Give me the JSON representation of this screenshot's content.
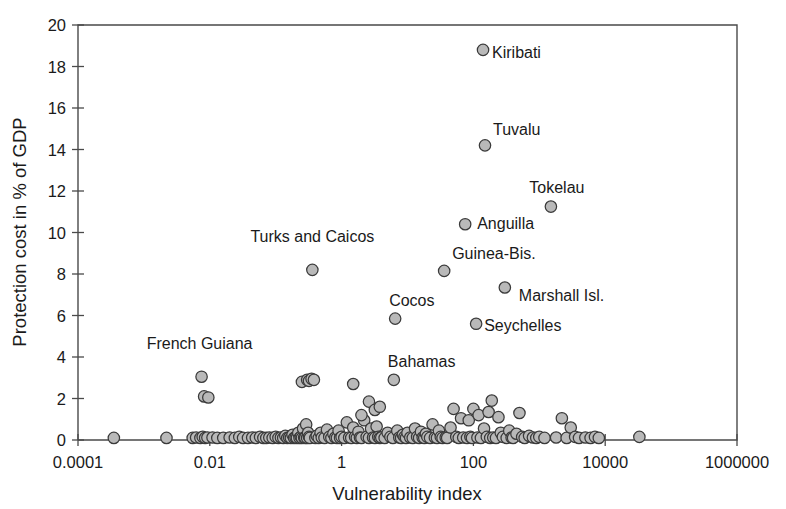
{
  "chart_data": {
    "type": "scatter",
    "title": "",
    "xlabel": "Vulnerability index",
    "ylabel": "Protection cost in % of GDP",
    "xscale": "log",
    "yscale": "linear",
    "xlim": [
      0.0001,
      1000000
    ],
    "ylim": [
      0,
      20
    ],
    "grid": false,
    "legend": null,
    "xticklabels": [
      "0.0001",
      "0.01",
      "1",
      "100",
      "10000",
      "1000000"
    ],
    "xtickvalues": [
      0.0001,
      0.01,
      1,
      100,
      10000,
      1000000
    ],
    "yticklabels": [
      "0",
      "2",
      "4",
      "6",
      "8",
      "10",
      "12",
      "14",
      "16",
      "18",
      "20"
    ],
    "ytickvalues": [
      0,
      2,
      4,
      6,
      8,
      10,
      12,
      14,
      16,
      18,
      20
    ],
    "marker_style": {
      "shape": "circle",
      "fill": "#b9b9b9",
      "edge": "#3a3a3a",
      "size": 7
    },
    "annotations": [
      {
        "label": "Kiribati",
        "x": 140,
        "y": 18.8,
        "anchor": "start",
        "dx": 9,
        "dy": 8
      },
      {
        "label": "Tuvalu",
        "x": 150,
        "y": 14.2,
        "anchor": "start",
        "dx": 8,
        "dy": -10
      },
      {
        "label": "Tokelau",
        "x": 1500,
        "y": 11.25,
        "anchor": "middle",
        "dx": 6,
        "dy": -14
      },
      {
        "label": "Anguilla",
        "x": 75,
        "y": 10.4,
        "anchor": "start",
        "dx": 12,
        "dy": 5
      },
      {
        "label": "Guinea-Bis.",
        "x": 36,
        "y": 8.15,
        "anchor": "start",
        "dx": 8,
        "dy": -12
      },
      {
        "label": "Marshall Isl.",
        "x": 300,
        "y": 7.35,
        "anchor": "start",
        "dx": 14,
        "dy": 14
      },
      {
        "label": "Cocos",
        "x": 6.5,
        "y": 5.85,
        "anchor": "start",
        "dx": -6,
        "dy": -13
      },
      {
        "label": "Seychelles",
        "x": 110,
        "y": 5.6,
        "anchor": "start",
        "dx": 8,
        "dy": 7
      },
      {
        "label": "Turks and Caicos",
        "x": 0.36,
        "y": 8.2,
        "anchor": "middle",
        "dx": 0,
        "dy": -28
      },
      {
        "label": "Bahamas",
        "x": 6.2,
        "y": 2.9,
        "anchor": "start",
        "dx": -6,
        "dy": -13
      },
      {
        "label": "French Guiana",
        "x": 0.007,
        "y": 3.05,
        "anchor": "middle",
        "dx": 0,
        "dy": -28
      }
    ],
    "labeled_points": [
      {
        "name": "Kiribati",
        "x": 140,
        "y": 18.8
      },
      {
        "name": "Tuvalu",
        "x": 150,
        "y": 14.2
      },
      {
        "name": "Tokelau",
        "x": 1500,
        "y": 11.25
      },
      {
        "name": "Anguilla",
        "x": 75,
        "y": 10.4
      },
      {
        "name": "Guinea-Bis.",
        "x": 36,
        "y": 8.15
      },
      {
        "name": "Marshall Isl.",
        "x": 300,
        "y": 7.35
      },
      {
        "name": "Cocos",
        "x": 6.5,
        "y": 5.85
      },
      {
        "name": "Seychelles",
        "x": 110,
        "y": 5.6
      },
      {
        "name": "Turks and Caicos",
        "x": 0.36,
        "y": 8.2
      },
      {
        "name": "Bahamas",
        "x": 6.2,
        "y": 2.9
      },
      {
        "name": "French Guiana",
        "x": 0.0075,
        "y": 3.05
      }
    ],
    "points": [
      [
        0.00035,
        0.1
      ],
      [
        0.0022,
        0.1
      ],
      [
        0.0055,
        0.1
      ],
      [
        0.0062,
        0.12
      ],
      [
        0.0072,
        0.1
      ],
      [
        0.0078,
        0.15
      ],
      [
        0.0085,
        0.1
      ],
      [
        0.0092,
        0.12
      ],
      [
        0.0075,
        3.05
      ],
      [
        0.0082,
        2.1
      ],
      [
        0.0095,
        2.05
      ],
      [
        0.011,
        0.12
      ],
      [
        0.013,
        0.1
      ],
      [
        0.016,
        0.1
      ],
      [
        0.02,
        0.12
      ],
      [
        0.024,
        0.1
      ],
      [
        0.028,
        0.15
      ],
      [
        0.032,
        0.1
      ],
      [
        0.038,
        0.1
      ],
      [
        0.044,
        0.12
      ],
      [
        0.05,
        0.1
      ],
      [
        0.058,
        0.15
      ],
      [
        0.065,
        0.1
      ],
      [
        0.072,
        0.1
      ],
      [
        0.08,
        0.12
      ],
      [
        0.09,
        0.1
      ],
      [
        0.1,
        0.15
      ],
      [
        0.11,
        0.1
      ],
      [
        0.12,
        0.12
      ],
      [
        0.13,
        0.1
      ],
      [
        0.14,
        0.2
      ],
      [
        0.15,
        0.1
      ],
      [
        0.16,
        0.12
      ],
      [
        0.17,
        0.1
      ],
      [
        0.18,
        0.25
      ],
      [
        0.19,
        0.1
      ],
      [
        0.2,
        0.12
      ],
      [
        0.21,
        0.1
      ],
      [
        0.22,
        0.35
      ],
      [
        0.23,
        0.1
      ],
      [
        0.24,
        0.15
      ],
      [
        0.25,
        0.1
      ],
      [
        0.26,
        0.55
      ],
      [
        0.27,
        0.12
      ],
      [
        0.28,
        0.1
      ],
      [
        0.29,
        0.75
      ],
      [
        0.3,
        0.1
      ],
      [
        0.31,
        0.35
      ],
      [
        0.32,
        0.15
      ],
      [
        0.33,
        0.1
      ],
      [
        0.25,
        2.8
      ],
      [
        0.3,
        2.9
      ],
      [
        0.32,
        2.85
      ],
      [
        0.35,
        2.95
      ],
      [
        0.38,
        2.9
      ],
      [
        0.36,
        8.2
      ],
      [
        0.4,
        0.1
      ],
      [
        0.42,
        0.2
      ],
      [
        0.45,
        0.1
      ],
      [
        0.48,
        0.35
      ],
      [
        0.5,
        0.12
      ],
      [
        0.55,
        0.1
      ],
      [
        0.6,
        0.5
      ],
      [
        0.65,
        0.15
      ],
      [
        0.7,
        0.1
      ],
      [
        0.75,
        0.3
      ],
      [
        0.8,
        0.12
      ],
      [
        0.85,
        0.1
      ],
      [
        0.9,
        0.45
      ],
      [
        0.95,
        0.1
      ],
      [
        1.0,
        0.15
      ],
      [
        1.1,
        0.1
      ],
      [
        1.2,
        0.85
      ],
      [
        1.3,
        0.12
      ],
      [
        1.4,
        0.1
      ],
      [
        1.5,
        0.6
      ],
      [
        1.6,
        0.15
      ],
      [
        1.7,
        0.1
      ],
      [
        1.8,
        0.4
      ],
      [
        1.9,
        0.12
      ],
      [
        2.0,
        0.1
      ],
      [
        2.2,
        0.95
      ],
      [
        2.4,
        0.15
      ],
      [
        2.6,
        0.1
      ],
      [
        2.8,
        0.55
      ],
      [
        3.0,
        0.12
      ],
      [
        3.2,
        0.1
      ],
      [
        3.4,
        0.65
      ],
      [
        3.6,
        0.15
      ],
      [
        3.8,
        0.1
      ],
      [
        1.5,
        2.7
      ],
      [
        2.0,
        1.2
      ],
      [
        2.6,
        1.85
      ],
      [
        3.2,
        1.45
      ],
      [
        3.8,
        1.6
      ],
      [
        4.0,
        0.12
      ],
      [
        4.5,
        0.1
      ],
      [
        5.0,
        0.35
      ],
      [
        5.5,
        0.15
      ],
      [
        6.0,
        0.1
      ],
      [
        6.2,
        2.9
      ],
      [
        6.5,
        5.85
      ],
      [
        7.0,
        0.45
      ],
      [
        7.5,
        0.12
      ],
      [
        8.0,
        0.1
      ],
      [
        8.5,
        0.25
      ],
      [
        9.0,
        0.15
      ],
      [
        9.5,
        0.1
      ],
      [
        10,
        0.35
      ],
      [
        11,
        0.12
      ],
      [
        12,
        0.1
      ],
      [
        13,
        0.55
      ],
      [
        14,
        0.15
      ],
      [
        15,
        0.1
      ],
      [
        16,
        0.4
      ],
      [
        17,
        0.12
      ],
      [
        18,
        0.1
      ],
      [
        19,
        0.3
      ],
      [
        20,
        0.15
      ],
      [
        22,
        0.1
      ],
      [
        24,
        0.75
      ],
      [
        26,
        0.12
      ],
      [
        28,
        0.1
      ],
      [
        30,
        0.45
      ],
      [
        32,
        0.15
      ],
      [
        34,
        0.1
      ],
      [
        36,
        8.15
      ],
      [
        38,
        0.12
      ],
      [
        40,
        0.1
      ],
      [
        45,
        0.6
      ],
      [
        50,
        1.5
      ],
      [
        55,
        0.15
      ],
      [
        60,
        0.1
      ],
      [
        65,
        1.05
      ],
      [
        70,
        0.12
      ],
      [
        75,
        10.4
      ],
      [
        80,
        0.1
      ],
      [
        85,
        0.95
      ],
      [
        90,
        0.15
      ],
      [
        95,
        0.1
      ],
      [
        100,
        1.5
      ],
      [
        110,
        5.6
      ],
      [
        115,
        0.12
      ],
      [
        120,
        1.2
      ],
      [
        130,
        0.1
      ],
      [
        140,
        18.8
      ],
      [
        145,
        0.55
      ],
      [
        150,
        14.2
      ],
      [
        160,
        0.15
      ],
      [
        170,
        1.35
      ],
      [
        180,
        0.1
      ],
      [
        190,
        1.9
      ],
      [
        200,
        0.12
      ],
      [
        220,
        0.1
      ],
      [
        240,
        1.1
      ],
      [
        260,
        0.35
      ],
      [
        280,
        0.15
      ],
      [
        300,
        7.35
      ],
      [
        320,
        0.1
      ],
      [
        350,
        0.45
      ],
      [
        380,
        0.12
      ],
      [
        400,
        0.1
      ],
      [
        450,
        0.3
      ],
      [
        500,
        1.3
      ],
      [
        550,
        0.15
      ],
      [
        600,
        0.1
      ],
      [
        700,
        0.2
      ],
      [
        800,
        0.12
      ],
      [
        900,
        0.1
      ],
      [
        1000,
        0.15
      ],
      [
        1200,
        0.1
      ],
      [
        1500,
        11.25
      ],
      [
        1800,
        0.12
      ],
      [
        2200,
        1.05
      ],
      [
        2600,
        0.1
      ],
      [
        3000,
        0.6
      ],
      [
        3500,
        0.15
      ],
      [
        4000,
        0.1
      ],
      [
        5000,
        0.12
      ],
      [
        6000,
        0.1
      ],
      [
        7000,
        0.15
      ],
      [
        8000,
        0.1
      ],
      [
        33000,
        0.15
      ]
    ]
  }
}
